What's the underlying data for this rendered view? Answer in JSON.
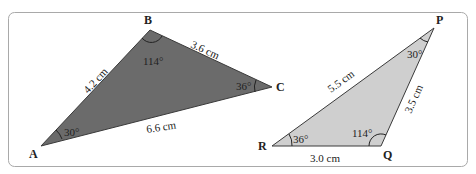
{
  "colors": {
    "frame": "#a9a9a9",
    "triangle_abc_fill": "#6b6b6b",
    "triangle_pqr_fill": "#cfcfcf",
    "stroke": "#3a3a3a",
    "text": "#222222"
  },
  "triangle_abc": {
    "vertices": {
      "A": "A",
      "B": "B",
      "C": "C"
    },
    "sides": {
      "AB": "4.2 cm",
      "BC": "3.6 cm",
      "AC": "6.6 cm"
    },
    "angles": {
      "A": "30°",
      "B": "114°",
      "C": "36°"
    }
  },
  "triangle_pqr": {
    "vertices": {
      "P": "P",
      "Q": "Q",
      "R": "R"
    },
    "sides": {
      "PR": "5.5 cm",
      "PQ": "3.5 cm",
      "RQ": "3.0 cm"
    },
    "angles": {
      "P": "30°",
      "Q": "114°",
      "R": "36°"
    }
  }
}
